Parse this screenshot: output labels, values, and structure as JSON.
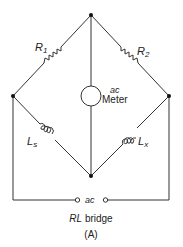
{
  "diagram": {
    "title": "RL bridge",
    "title_italic_part": "RL",
    "title_rest": "bridge",
    "subtitle": "(A)",
    "components": {
      "r1": {
        "label": "R",
        "sub": "1"
      },
      "r2": {
        "label": "R",
        "sub": "2"
      },
      "ls": {
        "label": "L",
        "sub": "s"
      },
      "lx": {
        "label": "L",
        "sub": "x"
      },
      "meter": {
        "line1": "ac",
        "line2": "Meter"
      },
      "source": {
        "label": "ac"
      }
    },
    "colors": {
      "line": "#333333",
      "background": "#ffffff"
    }
  }
}
